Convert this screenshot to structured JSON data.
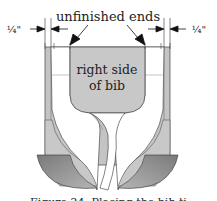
{
  "figure": {
    "labels": {
      "top_label": "unfinished ends",
      "left_measure": "¼\"",
      "right_measure": "¼\"",
      "center_label_line1": "right side",
      "center_label_line2": "of bib"
    },
    "caption": "Figure 24. Placing the bib ti",
    "colors": {
      "fabric_light": "#c8c8c8",
      "fabric_dark": "#8a8a8a",
      "outline": "#333333",
      "background": "#ffffff"
    }
  }
}
